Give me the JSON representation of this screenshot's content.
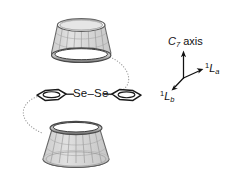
{
  "figure": {
    "background_color": "#ffffff",
    "title_visible": false,
    "guest": {
      "bridge_label": "Se–Se",
      "bridge_left_atom": "Se",
      "bridge_right_atom": "Se",
      "bridge_dash": "–",
      "aryl_ring_count": 2,
      "ring_description": "edge-on benzene ring"
    },
    "hosts": {
      "top_label": "cyclodextrin-cone-top",
      "bottom_label": "cyclodextrin-cone-bottom",
      "count": 2,
      "fill_color": "#d8d8d8",
      "rim_color": "#555555",
      "mesh_color": "#9a9a9a"
    },
    "tethers": {
      "style": "dotted",
      "count": 2,
      "color": "#9a9a9a"
    },
    "axes": {
      "origin_label": "axis-origin",
      "arrow_color": "#111111",
      "items": [
        {
          "name": "c7-axis",
          "symbol_italic": "C",
          "symbol_sub": "7",
          "symbol_rest": " axis",
          "direction": "up"
        },
        {
          "name": "1La-axis",
          "symbol_sup": "1",
          "symbol_italic": "L",
          "symbol_sub": "a",
          "direction": "right"
        },
        {
          "name": "1Lb-axis",
          "symbol_sup": "1",
          "symbol_italic": "L",
          "symbol_sub": "b",
          "direction": "down-left"
        }
      ]
    }
  }
}
